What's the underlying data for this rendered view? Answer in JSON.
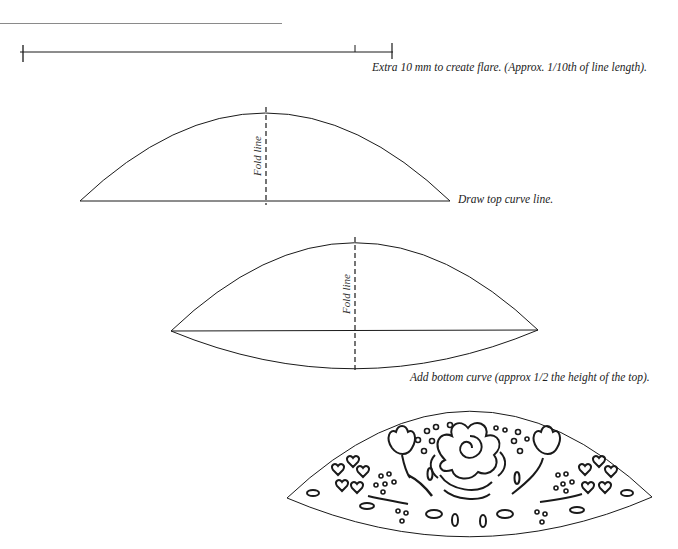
{
  "diagram": {
    "type": "pattern-construction-steps",
    "steps": [
      {
        "id": "step-1",
        "caption": "Extra 10 mm to create flare. (Approx. 1/10th of line length).",
        "elements": [
          "base line with end ticks",
          "inner tick marking extra length"
        ]
      },
      {
        "id": "step-2",
        "caption": "Draw top curve line.",
        "fold_label": "Fold line"
      },
      {
        "id": "step-3",
        "caption": "Add bottom curve (approx 1/2 the height of the top).",
        "fold_label": "Fold line"
      },
      {
        "id": "step-4",
        "caption": "",
        "description": "Finished cut-out shape with rose, tulips, hearts, dots and leaves motif"
      }
    ],
    "colors": {
      "stroke": "#1a1a1a",
      "rule": "#8a8a8a",
      "background": "#ffffff"
    }
  }
}
